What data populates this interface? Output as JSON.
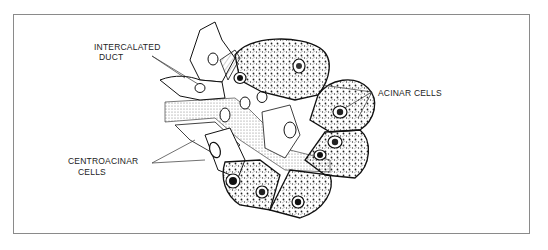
{
  "figure": {
    "labels": {
      "intercalated_duct": [
        "INTERCALATED",
        "DUCT"
      ],
      "acinar_cells": "ACINAR  CELLS",
      "centroacinar_cells": [
        "CENTROACINAR",
        "CELLS"
      ]
    }
  },
  "colors": {
    "ink": "#1a1a1a",
    "border": "#8a8a8a",
    "background": "#ffffff",
    "stipple": "#bdbdbd"
  }
}
